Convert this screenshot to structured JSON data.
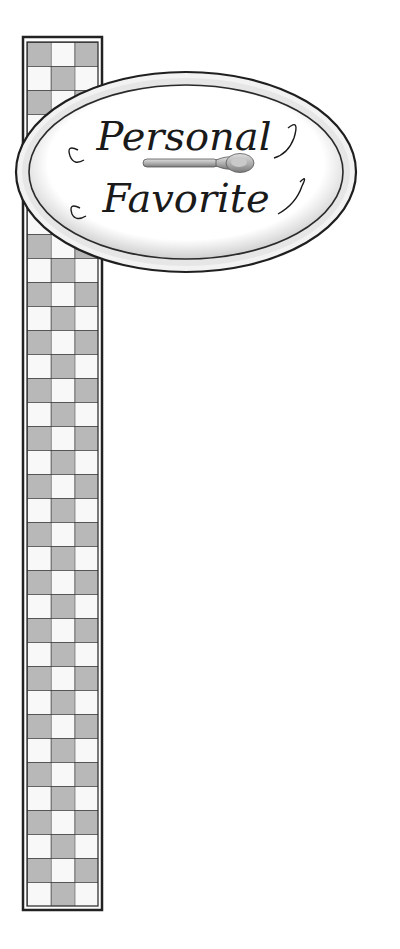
{
  "sign": {
    "line1": "Personal",
    "line2": "Favorite",
    "icon": "spoon-icon"
  },
  "colors": {
    "ink": "#1a1a1a",
    "check_dark": "#b8b8b8",
    "check_light": "#f8f8f8",
    "sign_fill": "#ffffff",
    "rim": "#e6e6e6"
  }
}
